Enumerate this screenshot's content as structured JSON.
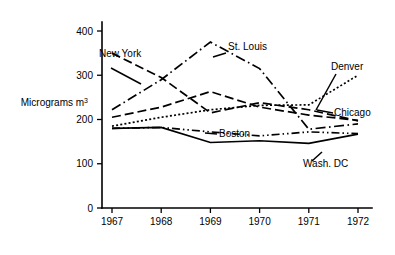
{
  "chart_data": {
    "type": "line",
    "title": "",
    "subtitle": "",
    "xlabel": "",
    "ylabel": "Micrograms m3",
    "ylabel_text": "Micrograms m",
    "ylabel_exponent": "3",
    "categories": [
      "1967",
      "1968",
      "1969",
      "1970",
      "1971",
      "1972"
    ],
    "x": [
      1967,
      1968,
      1969,
      1970,
      1971,
      1972
    ],
    "xlim": [
      1966.7,
      1972.5
    ],
    "ylim": [
      0,
      430
    ],
    "yticks": [
      0,
      100,
      200,
      300,
      400
    ],
    "ytick_labels": [
      "0",
      "100",
      "200",
      "300",
      "400"
    ],
    "xticks": [
      1967,
      1968,
      1969,
      1970,
      1971,
      1972
    ],
    "grid": false,
    "legend": "inline-labels",
    "monochrome": true,
    "line_color": "#000000",
    "background": "#ffffff",
    "series": [
      {
        "name": "New York",
        "label": "New York",
        "dash": "long-dash",
        "values": [
          350,
          295,
          215,
          238,
          222,
          197
        ]
      },
      {
        "name": "St. Louis",
        "label": "St. Louis",
        "dash": "dash-dot",
        "values": [
          222,
          290,
          375,
          315,
          178,
          190
        ]
      },
      {
        "name": "Denver",
        "label": "Denver",
        "dash": "dotted",
        "values": [
          185,
          205,
          222,
          232,
          233,
          300
        ]
      },
      {
        "name": "Chicago",
        "label": "Chicago",
        "dash": "long-dash",
        "values": [
          205,
          228,
          263,
          228,
          210,
          198
        ]
      },
      {
        "name": "Boston",
        "label": "Boston",
        "dash": "dash-dot-dot",
        "values": [
          180,
          182,
          172,
          163,
          172,
          168
        ]
      },
      {
        "name": "Wash. DC",
        "label": "Wash. DC",
        "dash": "solid",
        "values": [
          180,
          182,
          148,
          152,
          146,
          167
        ]
      }
    ],
    "annotations": [
      {
        "text": "New York",
        "anchor": "start"
      },
      {
        "text": "St. Louis",
        "anchor": "start"
      },
      {
        "text": "Denver",
        "anchor": "start"
      },
      {
        "text": "Chicago",
        "anchor": "start"
      },
      {
        "text": "Boston",
        "anchor": "start"
      },
      {
        "text": "Wash. DC",
        "anchor": "start"
      }
    ]
  }
}
